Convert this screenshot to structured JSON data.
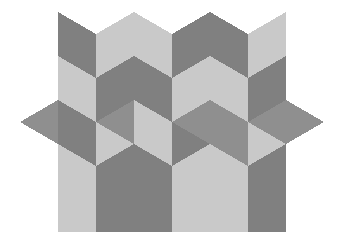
{
  "artwork": {
    "title": "Isometric Cube Tessellation",
    "description": "Rhombille tiling of 60/120 degree rhombi forming interlocking isometric cubes and six-point stars",
    "background_color": "#ffffff",
    "canvas": {
      "width": 349,
      "height": 251
    }
  },
  "palette": {
    "dark": "#808080",
    "medium": "#8f8f8f",
    "light": "#c9c9c9",
    "background": "#ffffff"
  },
  "geometry": {
    "rhombus_half_width": 38,
    "rhombus_half_height": 22,
    "column_x": [
      20,
      58,
      96,
      134,
      172,
      210,
      248,
      286,
      324
    ],
    "row_y": [
      12,
      34,
      56,
      78,
      100,
      122,
      144,
      166,
      188,
      210,
      232
    ],
    "note": "Isometric lattice: x step 38, y step 22"
  },
  "chart_data": {
    "type": "pattern",
    "title": "Isometric Cube Tessellation",
    "tone_count": 3,
    "tones": [
      "dark",
      "medium",
      "light"
    ],
    "facets": [
      {
        "id": "f01",
        "tone": "dark",
        "points": "58,12 96,34 96,78 58,56"
      },
      {
        "id": "f02",
        "tone": "light",
        "points": "96,34 134,12 134,56 96,78"
      },
      {
        "id": "f03",
        "tone": "light",
        "points": "134,12 172,34 172,78 134,56"
      },
      {
        "id": "f04",
        "tone": "dark",
        "points": "172,34 210,12 210,56 172,78"
      },
      {
        "id": "f05",
        "tone": "dark",
        "points": "210,12 248,34 248,78 210,56"
      },
      {
        "id": "f06",
        "tone": "light",
        "points": "248,34 286,12 286,56 248,78"
      },
      {
        "id": "f07",
        "tone": "light",
        "points": "58,56 96,78 96,122 58,100"
      },
      {
        "id": "f08",
        "tone": "dark",
        "points": "96,78 134,56 134,100 96,122"
      },
      {
        "id": "f09",
        "tone": "dark",
        "points": "134,56 172,78 172,122 134,100"
      },
      {
        "id": "f10",
        "tone": "light",
        "points": "172,78 210,56 210,100 172,122"
      },
      {
        "id": "f11",
        "tone": "light",
        "points": "210,56 248,78 248,122 210,100"
      },
      {
        "id": "f12",
        "tone": "dark",
        "points": "248,78 286,56 286,100 248,122"
      },
      {
        "id": "f13",
        "tone": "medium",
        "points": "20,122 58,100 96,122 58,144"
      },
      {
        "id": "f14",
        "tone": "dark",
        "points": "58,100 96,122 96,166 58,144"
      },
      {
        "id": "f15",
        "tone": "light",
        "points": "96,122 134,100 134,144 96,166"
      },
      {
        "id": "f16",
        "tone": "medium",
        "points": "96,122 134,100 172,122 134,144"
      },
      {
        "id": "f17",
        "tone": "light",
        "points": "134,100 172,122 172,166 134,144"
      },
      {
        "id": "f18",
        "tone": "dark",
        "points": "172,122 210,100 210,144 172,166"
      },
      {
        "id": "f19",
        "tone": "medium",
        "points": "172,122 210,100 248,122 210,144"
      },
      {
        "id": "f20",
        "tone": "medium",
        "points": "210,100 248,122 248,166 210,144"
      },
      {
        "id": "f21",
        "tone": "light",
        "points": "248,122 286,100 286,144 248,166"
      },
      {
        "id": "f22",
        "tone": "medium",
        "points": "248,122 286,100 324,122 286,144"
      },
      {
        "id": "f23",
        "tone": "medium",
        "points": "286,100 324,122 286,144 286,100"
      },
      {
        "id": "f24",
        "tone": "light",
        "points": "58,144 96,166 96,210 58,188"
      },
      {
        "id": "f25",
        "tone": "dark",
        "points": "96,166 134,144 134,188 96,210"
      },
      {
        "id": "f26",
        "tone": "dark",
        "points": "134,144 172,166 172,210 134,188"
      },
      {
        "id": "f27",
        "tone": "light",
        "points": "172,166 210,144 210,188 172,210"
      },
      {
        "id": "f28",
        "tone": "light",
        "points": "210,144 248,166 248,210 210,188"
      },
      {
        "id": "f29",
        "tone": "dark",
        "points": "248,166 286,144 286,188 248,210"
      },
      {
        "id": "f30",
        "tone": "light",
        "points": "58,188 96,210 96,232 58,232"
      },
      {
        "id": "f31",
        "tone": "dark",
        "points": "96,210 134,188 134,232 96,232"
      },
      {
        "id": "f32",
        "tone": "dark",
        "points": "134,188 172,210 172,232 134,232"
      },
      {
        "id": "f33",
        "tone": "light",
        "points": "172,210 210,188 210,232 172,232"
      },
      {
        "id": "f34",
        "tone": "light",
        "points": "210,188 248,210 248,232 210,232"
      },
      {
        "id": "f35",
        "tone": "dark",
        "points": "248,210 286,188 286,232 248,232"
      }
    ]
  }
}
